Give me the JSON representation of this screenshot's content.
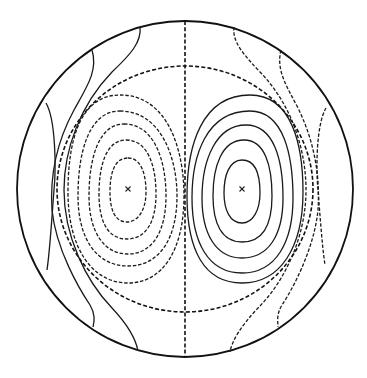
{
  "figure": {
    "type": "contour-plot-in-disk",
    "colors": {
      "line": "#1a1a1a",
      "background": "#ffffff"
    },
    "boundary": {
      "shape": "circle",
      "cx": 185,
      "cy": 189,
      "r": 168,
      "style": "solid"
    },
    "symmetry_line": {
      "style": "dashed",
      "x": 185
    },
    "separatrix": {
      "style": "dashed",
      "cx": 185,
      "cy": 189,
      "rx": 128,
      "ry": 123
    },
    "centers": [
      {
        "side": "left",
        "x": 128,
        "y": 189,
        "marker": "x"
      },
      {
        "side": "right",
        "x": 242,
        "y": 189,
        "marker": "x"
      }
    ],
    "left_cell": {
      "style": "dashed",
      "loops": [
        {
          "cx": 127,
          "cy": 191,
          "rx": 17,
          "ry": 32
        },
        {
          "cx": 127,
          "cy": 196,
          "rx": 28,
          "ry": 46
        },
        {
          "cx": 127,
          "cy": 199,
          "rx": 38,
          "ry": 62
        },
        {
          "cx": 127,
          "cy": 198,
          "rx": 49,
          "ry": 80
        },
        {
          "cx": 128,
          "cy": 189,
          "rx": 60,
          "ry": 95
        }
      ]
    },
    "right_cell": {
      "style": "solid",
      "loops": [
        {
          "cx": 242,
          "cy": 191,
          "rx": 17,
          "ry": 32
        },
        {
          "cx": 242,
          "cy": 198,
          "rx": 28,
          "ry": 46
        },
        {
          "cx": 242,
          "cy": 199,
          "rx": 39,
          "ry": 62
        },
        {
          "cx": 242,
          "cy": 199,
          "rx": 50,
          "ry": 80
        },
        {
          "cx": 241,
          "cy": 189,
          "rx": 62,
          "ry": 95
        }
      ]
    },
    "open_contours": {
      "left_style": "solid",
      "right_style": "dashed",
      "left_count": 3,
      "right_count": 3
    }
  }
}
